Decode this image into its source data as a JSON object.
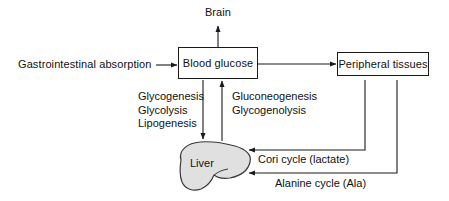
{
  "diagram": {
    "nodes": {
      "brain": {
        "label": "Brain",
        "shape": "plain-text"
      },
      "blood_glucose": {
        "label": "Blood glucose",
        "shape": "rectangle"
      },
      "peripheral_tissues": {
        "label": "Peripheral tissues",
        "shape": "rectangle"
      },
      "liver": {
        "label": "Liver",
        "shape": "organ-silhouette",
        "fill": "#e0e0e0",
        "stroke": "#3a3a3a"
      },
      "gi_absorption": {
        "label": "Gastrointestinal absorption",
        "shape": "plain-text"
      }
    },
    "pathway_labels": {
      "to_liver": {
        "lines": [
          "Glycogenesis",
          "Glycolysis",
          "Lipogenesis"
        ]
      },
      "from_liver": {
        "lines": [
          "Gluconeogenesis",
          "Glycogenolysis"
        ]
      }
    },
    "edge_labels": {
      "cori_cycle": "Cori cycle (lactate)",
      "alanine_cycle": "Alanine cycle (Ala)"
    },
    "colors": {
      "stroke": "#1a1a1a",
      "text": "#111111",
      "liver_fill": "#e0e0e0",
      "background": "#ffffff"
    }
  }
}
